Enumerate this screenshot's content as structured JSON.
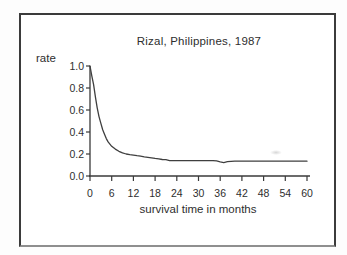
{
  "figure": {
    "title": "Rizal, Philippines, 1987",
    "ylabel": "rate",
    "xlabel": "survival time in months"
  },
  "chart_data": {
    "type": "line",
    "title": "Rizal, Philippines, 1987",
    "xlabel": "survival time in months",
    "ylabel": "rate",
    "xlim": [
      0,
      60
    ],
    "ylim": [
      0.0,
      1.0
    ],
    "x_ticks": [
      0,
      6,
      12,
      18,
      24,
      30,
      36,
      42,
      48,
      54,
      60
    ],
    "y_tick_labels": [
      "1.0",
      "0.8",
      "0.6",
      "0.4",
      "0.2",
      "0.0"
    ],
    "grid": false,
    "legend": "none",
    "series": [
      {
        "name": "survival rate",
        "x": [
          0,
          0.5,
          1,
          1.5,
          2,
          2.5,
          3,
          3.5,
          4,
          4.5,
          5,
          6,
          7,
          8,
          9,
          10,
          11,
          12,
          13,
          14,
          15,
          16,
          17,
          18,
          19,
          20,
          21,
          22,
          23,
          24,
          26,
          28,
          30,
          32,
          34,
          35,
          36,
          37,
          38,
          40,
          44,
          48,
          52,
          56,
          60
        ],
        "y": [
          1.0,
          0.91,
          0.83,
          0.72,
          0.62,
          0.54,
          0.48,
          0.42,
          0.38,
          0.34,
          0.31,
          0.27,
          0.245,
          0.225,
          0.21,
          0.2,
          0.195,
          0.19,
          0.185,
          0.18,
          0.175,
          0.17,
          0.165,
          0.16,
          0.155,
          0.15,
          0.148,
          0.14,
          0.14,
          0.14,
          0.14,
          0.14,
          0.14,
          0.14,
          0.14,
          0.137,
          0.128,
          0.122,
          0.13,
          0.135,
          0.135,
          0.135,
          0.135,
          0.135,
          0.135
        ]
      }
    ],
    "colors": {
      "line": "#3f3f3f",
      "axis": "#3a3a3a",
      "text": "#2e2e2e",
      "frame": "#3b3b3b",
      "background": "#ffffff"
    }
  }
}
